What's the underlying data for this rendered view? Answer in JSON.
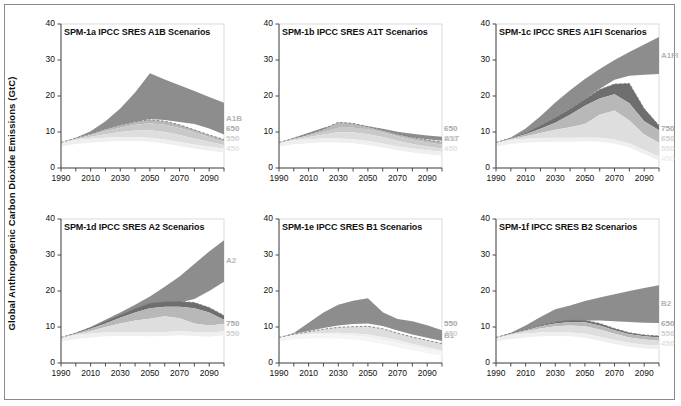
{
  "figure": {
    "ylabel": "Global Anthropogenic Carbon Dioxide Emissions (GtC)",
    "colors": {
      "scenario_band": "#8d8d8d",
      "dark_band": "#6e6e6e",
      "mid_band": "#b8b8b8",
      "light_band": "#d9d9d9",
      "lighter_band": "#e8e8e8",
      "lightest_band": "#f1f1f1",
      "axis": "#4a4a4a",
      "frame": "#8a8a8a",
      "title_text": "#111111"
    },
    "axes": {
      "ylim": [
        0,
        40
      ],
      "yticks": [
        0,
        10,
        20,
        30,
        40
      ],
      "xlim": [
        1990,
        2100
      ],
      "xticks": [
        1990,
        2010,
        2030,
        2050,
        2070,
        2090
      ],
      "xtick_minor_step": 10,
      "grid": false
    }
  },
  "chart_data": [
    {
      "type": "area",
      "panel_id": "SPM-1a",
      "title": "SPM-1a IPCC SRES A1B Scenarios",
      "xlabel": "",
      "ylabel": "Global Anthropogenic Carbon Dioxide Emissions (GtC)",
      "xlim": [
        1990,
        2100
      ],
      "ylim": [
        0,
        40
      ],
      "x": [
        1990,
        2000,
        2010,
        2020,
        2030,
        2040,
        2050,
        2060,
        2070,
        2080,
        2090,
        2100
      ],
      "edge_labels": [
        "A1B",
        "650",
        "550",
        "450"
      ],
      "series": [
        {
          "name": "A1B scenario range (upper)",
          "color": "#8d8d8d",
          "values": [
            7.1,
            8.4,
            10.2,
            13.0,
            16.5,
            21.0,
            26.3,
            24.6,
            23.0,
            21.4,
            19.7,
            18.1
          ]
        },
        {
          "name": "A1B scenario range (lower)",
          "color": "#8d8d8d",
          "values": [
            7.1,
            8.3,
            9.4,
            10.7,
            11.8,
            12.8,
            13.6,
            13.3,
            12.8,
            12.2,
            11.0,
            9.3
          ]
        },
        {
          "name": "WRE750 stabilization (upper)",
          "color": "#b8b8b8",
          "values": [
            7.1,
            8.3,
            9.5,
            10.9,
            12.0,
            12.9,
            13.4,
            13.0,
            12.0,
            10.6,
            9.2,
            7.9
          ]
        },
        {
          "name": "WRE650 stabilization",
          "color": "#c9c9c9",
          "values": [
            7.1,
            8.2,
            9.2,
            10.3,
            11.2,
            12.0,
            12.4,
            12.0,
            11.1,
            9.9,
            8.6,
            7.3
          ]
        },
        {
          "name": "WRE550 stabilization",
          "color": "#dedede",
          "values": [
            7.1,
            8.0,
            8.7,
            9.4,
            10.0,
            10.4,
            10.5,
            10.0,
            9.2,
            8.2,
            7.3,
            6.4
          ]
        },
        {
          "name": "WRE450 stabilization",
          "color": "#efefef",
          "values": [
            7.1,
            7.8,
            8.1,
            8.4,
            8.6,
            8.6,
            8.4,
            7.9,
            7.2,
            6.5,
            5.9,
            5.4
          ]
        }
      ]
    },
    {
      "type": "area",
      "panel_id": "SPM-1b",
      "title": "SPM-1b IPCC SRES A1T Scenarios",
      "xlabel": "",
      "ylabel": "",
      "xlim": [
        1990,
        2100
      ],
      "ylim": [
        0,
        40
      ],
      "x": [
        1990,
        2000,
        2010,
        2020,
        2030,
        2040,
        2050,
        2060,
        2070,
        2080,
        2090,
        2100
      ],
      "edge_labels": [
        "A1T",
        "650",
        "550",
        "450"
      ],
      "series": [
        {
          "name": "A1T scenario range (upper)",
          "color": "#8d8d8d",
          "values": [
            7.1,
            8.4,
            9.8,
            11.2,
            12.3,
            12.2,
            11.6,
            10.9,
            10.1,
            9.5,
            9.0,
            8.7
          ]
        },
        {
          "name": "A1T scenario range (lower)",
          "color": "#8d8d8d",
          "values": [
            7.1,
            8.2,
            9.2,
            10.2,
            11.0,
            11.2,
            10.8,
            10.1,
            9.2,
            8.5,
            8.0,
            7.6
          ]
        },
        {
          "name": "WRE750 stabilization",
          "color": "#b8b8b8",
          "values": [
            7.1,
            8.2,
            9.4,
            10.8,
            12.7,
            12.4,
            11.5,
            10.5,
            9.4,
            8.5,
            7.8,
            7.2
          ]
        },
        {
          "name": "WRE650 stabilization",
          "color": "#c9c9c9",
          "values": [
            7.1,
            8.1,
            9.1,
            10.2,
            11.4,
            11.4,
            10.8,
            9.9,
            8.8,
            7.9,
            7.1,
            6.5
          ]
        },
        {
          "name": "WRE550 stabilization",
          "color": "#dedede",
          "values": [
            7.1,
            7.9,
            8.6,
            9.3,
            9.9,
            9.9,
            9.4,
            8.6,
            7.6,
            6.7,
            6.0,
            5.4
          ]
        },
        {
          "name": "WRE450 stabilization",
          "color": "#efefef",
          "values": [
            7.1,
            7.7,
            8.0,
            8.2,
            8.2,
            8.0,
            7.5,
            6.8,
            6.0,
            5.4,
            4.9,
            4.5
          ]
        }
      ]
    },
    {
      "type": "area",
      "panel_id": "SPM-1c",
      "title": "SPM-1c IPCC SRES A1FI Scenarios",
      "xlabel": "",
      "ylabel": "",
      "xlim": [
        1990,
        2100
      ],
      "ylim": [
        0,
        40
      ],
      "x": [
        1990,
        2000,
        2010,
        2020,
        2030,
        2040,
        2050,
        2060,
        2070,
        2080,
        2090,
        2100
      ],
      "edge_labels": [
        "A1FI",
        "750",
        "650",
        "550",
        "450"
      ],
      "series": [
        {
          "name": "A1FI scenario range (upper)",
          "color": "#8d8d8d",
          "values": [
            7.1,
            8.5,
            11.0,
            14.4,
            18.2,
            21.6,
            24.7,
            27.5,
            30.0,
            32.2,
            34.3,
            36.4
          ]
        },
        {
          "name": "A1FI scenario range (lower)",
          "color": "#8d8d8d",
          "values": [
            7.1,
            8.3,
            9.8,
            11.8,
            14.0,
            16.4,
            19.1,
            22.0,
            24.5,
            25.6,
            25.9,
            26.1
          ]
        },
        {
          "name": "WRE750 stabilization",
          "color": "#6e6e6e",
          "values": [
            7.1,
            8.3,
            9.8,
            11.8,
            14.0,
            16.4,
            19.1,
            21.8,
            23.3,
            23.5,
            16.5,
            11.8
          ]
        },
        {
          "name": "WRE650 stabilization",
          "color": "#b8b8b8",
          "values": [
            7.1,
            8.2,
            9.4,
            10.9,
            12.6,
            14.8,
            17.3,
            19.3,
            20.5,
            18.0,
            13.0,
            10.5
          ]
        },
        {
          "name": "WRE550 stabilization",
          "color": "#dedede",
          "values": [
            7.1,
            8.0,
            8.8,
            9.7,
            10.6,
            11.3,
            12.2,
            14.8,
            16.0,
            13.2,
            9.3,
            7.0
          ]
        },
        {
          "name": "WRE450 stabilization",
          "color": "#efefef",
          "values": [
            7.1,
            7.8,
            8.1,
            8.3,
            8.4,
            8.4,
            8.5,
            8.4,
            7.9,
            6.8,
            5.0,
            3.2
          ]
        }
      ]
    },
    {
      "type": "area",
      "panel_id": "SPM-1d",
      "title": "SPM-1d IPCC SRES A2 Scenarios",
      "xlabel": "",
      "ylabel": "",
      "xlim": [
        1990,
        2100
      ],
      "ylim": [
        0,
        40
      ],
      "x": [
        1990,
        2000,
        2010,
        2020,
        2030,
        2040,
        2050,
        2060,
        2070,
        2080,
        2090,
        2100
      ],
      "edge_labels": [
        "A2",
        "750",
        "550"
      ],
      "series": [
        {
          "name": "A2 scenario range (upper)",
          "color": "#8d8d8d",
          "values": [
            7.1,
            8.4,
            10.0,
            12.0,
            14.0,
            16.2,
            18.5,
            21.2,
            24.0,
            27.5,
            31.0,
            34.1
          ]
        },
        {
          "name": "A2 scenario range (lower)",
          "color": "#8d8d8d",
          "values": [
            7.1,
            8.3,
            9.6,
            11.2,
            12.8,
            14.2,
            15.7,
            16.4,
            16.8,
            17.8,
            20.0,
            22.6
          ]
        },
        {
          "name": "WRE750 stabilization",
          "color": "#6e6e6e",
          "values": [
            7.1,
            8.3,
            9.8,
            11.5,
            13.3,
            15.1,
            16.6,
            17.0,
            17.1,
            16.8,
            15.4,
            13.2
          ]
        },
        {
          "name": "WRE650 stabilization",
          "color": "#b8b8b8",
          "values": [
            7.1,
            8.2,
            9.5,
            11.0,
            12.6,
            14.0,
            15.2,
            15.6,
            15.6,
            15.2,
            14.0,
            12.0
          ]
        },
        {
          "name": "WRE550 stabilization",
          "color": "#dedede",
          "values": [
            7.1,
            8.0,
            8.9,
            10.0,
            11.0,
            11.8,
            12.3,
            13.0,
            12.4,
            11.0,
            10.4,
            10.8
          ]
        },
        {
          "name": "WRE450 stabilization",
          "color": "#efefef",
          "values": [
            7.1,
            7.8,
            8.2,
            8.5,
            8.6,
            8.6,
            8.5,
            8.6,
            8.8,
            8.6,
            8.4,
            8.8
          ]
        }
      ]
    },
    {
      "type": "area",
      "panel_id": "SPM-1e",
      "title": "SPM-1e IPCC SRES B1 Scenarios",
      "xlabel": "",
      "ylabel": "",
      "xlim": [
        1990,
        2100
      ],
      "ylim": [
        0,
        40
      ],
      "x": [
        1990,
        2000,
        2010,
        2020,
        2030,
        2040,
        2050,
        2060,
        2070,
        2080,
        2090,
        2100
      ],
      "edge_labels": [
        "B1",
        "550",
        "450"
      ],
      "series": [
        {
          "name": "B1 scenario range (upper)",
          "color": "#8d8d8d",
          "values": [
            7.1,
            8.3,
            11.2,
            14.0,
            16.2,
            17.3,
            18.0,
            14.1,
            12.2,
            11.6,
            10.5,
            9.1
          ]
        },
        {
          "name": "B1 scenario range (lower)",
          "color": "#8d8d8d",
          "values": [
            7.1,
            8.1,
            8.9,
            9.7,
            10.4,
            10.8,
            11.0,
            10.3,
            9.0,
            7.9,
            7.0,
            6.1
          ]
        },
        {
          "name": "WRE550 stabilization",
          "color": "#dedede",
          "values": [
            7.1,
            8.0,
            8.7,
            9.4,
            9.9,
            10.1,
            10.2,
            9.5,
            8.3,
            7.2,
            6.3,
            5.4
          ]
        },
        {
          "name": "WRE450 stabilization",
          "color": "#efefef",
          "values": [
            7.1,
            7.8,
            8.1,
            8.3,
            8.4,
            8.2,
            7.9,
            7.2,
            6.3,
            5.3,
            4.4,
            3.5
          ]
        },
        {
          "name": "lower bound",
          "color": "#f5f5f5",
          "values": [
            7.1,
            7.7,
            7.9,
            8.0,
            7.9,
            7.6,
            7.2,
            6.4,
            5.5,
            4.6,
            3.8,
            3.1
          ]
        }
      ]
    },
    {
      "type": "area",
      "panel_id": "SPM-1f",
      "title": "SPM-1f IPCC SRES B2 Scenarios",
      "xlabel": "",
      "ylabel": "",
      "xlim": [
        1990,
        2100
      ],
      "ylim": [
        0,
        40
      ],
      "x": [
        1990,
        2000,
        2010,
        2020,
        2030,
        2040,
        2050,
        2060,
        2070,
        2080,
        2090,
        2100
      ],
      "edge_labels": [
        "B2",
        "650",
        "550",
        "450"
      ],
      "series": [
        {
          "name": "B2 scenario range (upper)",
          "color": "#8d8d8d",
          "values": [
            7.1,
            8.4,
            10.4,
            12.8,
            14.9,
            16.0,
            17.2,
            18.2,
            19.1,
            20.0,
            20.8,
            21.6
          ]
        },
        {
          "name": "B2 scenario range (lower)",
          "color": "#8d8d8d",
          "values": [
            7.1,
            8.2,
            9.3,
            10.5,
            11.3,
            11.6,
            11.8,
            11.8,
            11.6,
            11.4,
            11.2,
            11.1
          ]
        },
        {
          "name": "WRE750 stabilization",
          "color": "#6e6e6e",
          "values": [
            7.1,
            8.2,
            9.3,
            10.5,
            11.4,
            11.9,
            11.9,
            11.0,
            9.6,
            8.4,
            7.8,
            7.5
          ]
        },
        {
          "name": "WRE650 stabilization",
          "color": "#b8b8b8",
          "values": [
            7.1,
            8.1,
            9.1,
            10.2,
            11.0,
            11.4,
            11.3,
            10.4,
            9.1,
            8.0,
            7.4,
            7.1
          ]
        },
        {
          "name": "WRE550 stabilization",
          "color": "#dedede",
          "values": [
            7.1,
            8.0,
            8.8,
            9.6,
            10.2,
            10.4,
            10.2,
            9.3,
            8.1,
            7.1,
            6.5,
            6.2
          ]
        },
        {
          "name": "WRE450 stabilization",
          "color": "#efefef",
          "values": [
            7.1,
            7.8,
            8.2,
            8.5,
            8.6,
            8.5,
            8.1,
            7.3,
            6.4,
            5.6,
            5.1,
            4.9
          ]
        }
      ]
    }
  ]
}
